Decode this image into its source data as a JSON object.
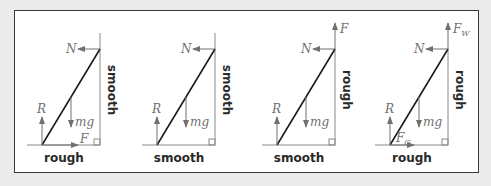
{
  "figure": {
    "colors": {
      "background": "#ebebeb",
      "panel": "#ffffff",
      "border": "#3a3a3a",
      "ladder": "#1a1a1a",
      "force": "#707070",
      "label": "#2a2a2a"
    },
    "diagrams": [
      {
        "id": 1,
        "ground_label": "rough",
        "wall_label": "smooth",
        "forces": {
          "N": "N",
          "R": "R",
          "mg": "mg",
          "F_ground": "F"
        }
      },
      {
        "id": 2,
        "ground_label": "smooth",
        "wall_label": "smooth",
        "forces": {
          "N": "N",
          "R": "R",
          "mg": "mg"
        }
      },
      {
        "id": 3,
        "ground_label": "smooth",
        "wall_label": "rough",
        "forces": {
          "N": "N",
          "R": "R",
          "mg": "mg",
          "F_wall": "F"
        }
      },
      {
        "id": 4,
        "ground_label": "rough",
        "wall_label": "rough",
        "forces": {
          "N": "N",
          "R": "R",
          "mg": "mg",
          "F_wall": "F",
          "F_wall_sub": "W",
          "F_ground": "F",
          "F_ground_sub": "G"
        }
      }
    ]
  }
}
